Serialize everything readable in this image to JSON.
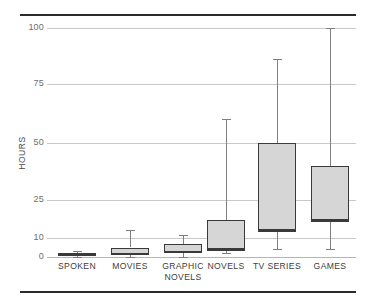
{
  "chart_data": {
    "type": "box",
    "title": "",
    "subtitle": "",
    "xlabel": "",
    "ylabel": "HOURS",
    "grid": true,
    "legend": false,
    "yticks": [
      0,
      10,
      25,
      50,
      75,
      100
    ],
    "ytick_labels": [
      "0",
      "10",
      "25",
      "50",
      "75",
      "100"
    ],
    "ylim": [
      0,
      100
    ],
    "y_scale_note": "non-linear compressed axis",
    "categories": [
      "SPOKEN",
      "MOVIES",
      "GRAPHIC NOVELS",
      "NOVELS",
      "TV SERIES",
      "GAMES"
    ],
    "category_label_lines": [
      [
        "SPOKEN"
      ],
      [
        "MOVIES"
      ],
      [
        "GRAPHIC",
        "NOVELS"
      ],
      [
        "NOVELS"
      ],
      [
        "TV SERIES"
      ],
      [
        "GAMES"
      ]
    ],
    "boxes": [
      {
        "category": "SPOKEN",
        "whisker_low": 0,
        "q1": 0.5,
        "median": 1.5,
        "q3": 2,
        "whisker_high": 3
      },
      {
        "category": "MOVIES",
        "whisker_low": 0,
        "q1": 1,
        "median": 2,
        "q3": 5,
        "whisker_high": 13
      },
      {
        "category": "GRAPHIC NOVELS",
        "whisker_low": 0,
        "q1": 2,
        "median": 3,
        "q3": 7,
        "whisker_high": 11
      },
      {
        "category": "NOVELS",
        "whisker_low": 2,
        "q1": 4,
        "median": 4,
        "q3": 17,
        "whisker_high": 60
      },
      {
        "category": "TV SERIES",
        "whisker_low": 4,
        "q1": 13,
        "median": 13,
        "q3": 50,
        "whisker_high": 86
      },
      {
        "category": "GAMES",
        "whisker_low": 4,
        "q1": 17,
        "median": 17,
        "q3": 40,
        "whisker_high": 100
      }
    ],
    "colors": {
      "box_fill": "#d6d6d6",
      "box_border": "#3a3a3a",
      "whisker": "#808080",
      "grid": "#c9c9c9",
      "rule": "#2b2b2b",
      "tick_text": "#6d6d6d",
      "label_text": "#3d3d3d"
    }
  },
  "axis_pixel_map": {
    "0": 257,
    "10": 238,
    "25": 200,
    "50": 143,
    "75": 84,
    "100": 28
  },
  "category_pixel_centers": [
    77,
    130,
    183,
    226,
    277,
    330
  ]
}
